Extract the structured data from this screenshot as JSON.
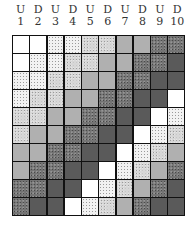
{
  "columns": [
    {
      "letter": "U",
      "number": "1"
    },
    {
      "letter": "D",
      "number": "2"
    },
    {
      "letter": "U",
      "number": "3"
    },
    {
      "letter": "D",
      "number": "4"
    },
    {
      "letter": "U",
      "number": "5"
    },
    {
      "letter": "D",
      "number": "6"
    },
    {
      "letter": "U",
      "number": "7"
    },
    {
      "letter": "D",
      "number": "8"
    },
    {
      "letter": "U",
      "number": "9"
    },
    {
      "letter": "D",
      "number": "10"
    }
  ],
  "tone_legend": {
    "W": {
      "name": "white",
      "color": "#ffffff"
    },
    "L": {
      "name": "light-stipple",
      "color": "#f2f2f2"
    },
    "M": {
      "name": "medium-stipple",
      "color": "#d6d6d6"
    },
    "G": {
      "name": "gray",
      "color": "#b0b0b0"
    },
    "D": {
      "name": "dark-speckle",
      "color": "#737373"
    },
    "X": {
      "name": "darkest",
      "color": "#5a5a5a"
    }
  },
  "grid": [
    [
      "W",
      "W",
      "L",
      "L",
      "M",
      "M",
      "G",
      "G",
      "D",
      "D"
    ],
    [
      "W",
      "L",
      "L",
      "M",
      "M",
      "G",
      "G",
      "D",
      "D",
      "X"
    ],
    [
      "L",
      "L",
      "M",
      "M",
      "G",
      "G",
      "D",
      "D",
      "X",
      "X"
    ],
    [
      "L",
      "M",
      "M",
      "G",
      "G",
      "D",
      "D",
      "X",
      "X",
      "W"
    ],
    [
      "M",
      "M",
      "G",
      "G",
      "D",
      "D",
      "X",
      "X",
      "W",
      "L"
    ],
    [
      "M",
      "G",
      "G",
      "D",
      "D",
      "X",
      "X",
      "W",
      "L",
      "M"
    ],
    [
      "G",
      "G",
      "D",
      "D",
      "X",
      "X",
      "W",
      "L",
      "M",
      "G"
    ],
    [
      "G",
      "D",
      "D",
      "X",
      "X",
      "W",
      "L",
      "M",
      "G",
      "D"
    ],
    [
      "D",
      "D",
      "X",
      "X",
      "W",
      "L",
      "M",
      "G",
      "D",
      "X"
    ],
    [
      "D",
      "X",
      "X",
      "W",
      "L",
      "M",
      "G",
      "D",
      "X",
      "X"
    ]
  ]
}
